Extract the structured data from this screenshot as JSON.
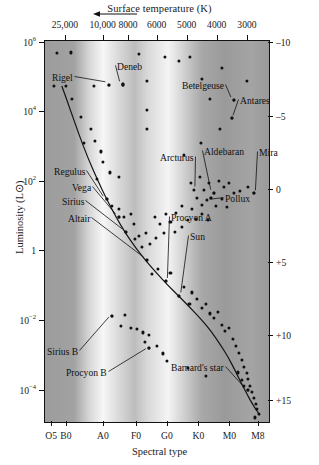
{
  "figure": {
    "type": "hertzsprung-russell-diagram",
    "top_axis_title": "Surface temperature (K)",
    "left_axis_title": "Luminosity (L⊙)",
    "right_axis_title": "Absolute magnitude",
    "bottom_axis_title": "Spectral type"
  },
  "chart_data": {
    "type": "scatter",
    "title": "",
    "xlabel": "Spectral type",
    "ylabel": "Luminosity (L⊙)",
    "grid": false,
    "legend": "none",
    "axes": {
      "top": {
        "label": "Surface temperature (K)",
        "direction": "decreasing-left-to-right",
        "ticks": [
          {
            "text": "25,000",
            "x_frac": 0.093
          },
          {
            "text": "10,000",
            "x_frac": 0.262
          },
          {
            "text": "8000",
            "x_frac": 0.375
          },
          {
            "text": "6000",
            "x_frac": 0.503
          },
          {
            "text": "5000",
            "x_frac": 0.637
          },
          {
            "text": "4000",
            "x_frac": 0.771
          },
          {
            "text": "3000",
            "x_frac": 0.906
          }
        ]
      },
      "left": {
        "label": "Luminosity (L⊙)",
        "scale": "log",
        "ticks": [
          {
            "mantissa": "10",
            "exp": "6",
            "text": "10⁶",
            "y_frac": 0.006
          },
          {
            "mantissa": "10",
            "exp": "4",
            "text": "10⁴",
            "y_frac": 0.186
          },
          {
            "mantissa": "10",
            "exp": "2",
            "text": "10²",
            "y_frac": 0.37
          },
          {
            "mantissa": "1",
            "exp": "",
            "text": "1",
            "y_frac": 0.551
          },
          {
            "mantissa": "10",
            "exp": "-2",
            "text": "10⁻²",
            "y_frac": 0.735
          },
          {
            "mantissa": "10",
            "exp": "-4",
            "text": "10⁻⁴",
            "y_frac": 0.919
          }
        ]
      },
      "right": {
        "label": "Absolute magnitude",
        "ticks": [
          {
            "text": "–10",
            "y_frac": 0.006
          },
          {
            "text": "–5",
            "y_frac": 0.199
          },
          {
            "text": "0",
            "y_frac": 0.391
          },
          {
            "text": "+5",
            "y_frac": 0.583
          },
          {
            "text": "+10",
            "y_frac": 0.775
          },
          {
            "text": "+15",
            "y_frac": 0.945
          }
        ]
      },
      "bottom": {
        "label": "Spectral type",
        "ticks": [
          {
            "text": "O5",
            "x_frac": 0.032
          },
          {
            "text": "B0",
            "x_frac": 0.098
          },
          {
            "text": "A0",
            "x_frac": 0.263
          },
          {
            "text": "F0",
            "x_frac": 0.411
          },
          {
            "text": "G0",
            "x_frac": 0.549
          },
          {
            "text": "K0",
            "x_frac": 0.689
          },
          {
            "text": "M0",
            "x_frac": 0.828
          },
          {
            "text": "M8",
            "x_frac": 0.955
          }
        ]
      }
    },
    "background_bands": [
      {
        "x_frac": 0.0,
        "color": "#9c9c9c"
      },
      {
        "x_frac": 0.13,
        "color": "#a2a2a2"
      },
      {
        "x_frac": 0.2,
        "color": "#d8d8d8"
      },
      {
        "x_frac": 0.26,
        "color": "#f7f7f7"
      },
      {
        "x_frac": 0.32,
        "color": "#dddddd"
      },
      {
        "x_frac": 0.4,
        "color": "#bdbdbd"
      },
      {
        "x_frac": 0.46,
        "color": "#d9d9d9"
      },
      {
        "x_frac": 0.55,
        "color": "#f4f4f4"
      },
      {
        "x_frac": 0.62,
        "color": "#d0d0d0"
      },
      {
        "x_frac": 0.7,
        "color": "#a8a8a8"
      },
      {
        "x_frac": 0.8,
        "color": "#9a9a9a"
      },
      {
        "x_frac": 0.92,
        "color": "#a4a4a4"
      },
      {
        "x_frac": 1.0,
        "color": "#9a9a9a"
      }
    ],
    "main_sequence_curve": [
      [
        0.075,
        0.118
      ],
      [
        0.11,
        0.175
      ],
      [
        0.15,
        0.243
      ],
      [
        0.19,
        0.305
      ],
      [
        0.232,
        0.362
      ],
      [
        0.275,
        0.415
      ],
      [
        0.318,
        0.463
      ],
      [
        0.36,
        0.505
      ],
      [
        0.405,
        0.543
      ],
      [
        0.452,
        0.578
      ],
      [
        0.5,
        0.61
      ],
      [
        0.548,
        0.641
      ],
      [
        0.598,
        0.67
      ],
      [
        0.648,
        0.7
      ],
      [
        0.698,
        0.731
      ],
      [
        0.742,
        0.762
      ],
      [
        0.782,
        0.796
      ],
      [
        0.818,
        0.83
      ],
      [
        0.85,
        0.866
      ],
      [
        0.878,
        0.9
      ],
      [
        0.903,
        0.928
      ],
      [
        0.924,
        0.951
      ],
      [
        0.943,
        0.968
      ],
      [
        0.96,
        0.982
      ]
    ],
    "named_stars": [
      {
        "name": "Rigel",
        "label_x": 52,
        "label_y": 72,
        "anchor": "left",
        "dot": [
          0.285,
          0.115
        ]
      },
      {
        "name": "Deneb",
        "label_x": 117,
        "label_y": 61,
        "anchor": "left",
        "dot": [
          0.348,
          0.114
        ]
      },
      {
        "name": "Betelgeuse",
        "label_x": 182,
        "label_y": 80,
        "anchor": "left",
        "dot": [
          0.845,
          0.155
        ]
      },
      {
        "name": "Antares",
        "label_x": 240,
        "label_y": 95,
        "anchor": "left",
        "dot": [
          0.833,
          0.203
        ]
      },
      {
        "name": "Arcturus",
        "label_x": 160,
        "label_y": 152,
        "anchor": "left",
        "dot": [
          0.663,
          0.39
        ]
      },
      {
        "name": "Aldebaran",
        "label_x": 204,
        "label_y": 146,
        "anchor": "left",
        "dot": [
          0.755,
          0.398
        ]
      },
      {
        "name": "Mira",
        "label_x": 259,
        "label_y": 147,
        "anchor": "left",
        "dot": [
          0.933,
          0.4
        ]
      },
      {
        "name": "Pollux",
        "label_x": 225,
        "label_y": 193,
        "anchor": "left",
        "dot": [
          0.74,
          0.412
        ]
      },
      {
        "name": "Regulus",
        "label_x": 54,
        "label_y": 166,
        "anchor": "left",
        "dot": [
          0.275,
          0.415
        ]
      },
      {
        "name": "Vega",
        "label_x": 72,
        "label_y": 182,
        "anchor": "left",
        "dot": [
          0.33,
          0.462
        ]
      },
      {
        "name": "Sirius",
        "label_x": 62,
        "label_y": 196,
        "anchor": "left",
        "dot": [
          0.36,
          0.501
        ]
      },
      {
        "name": "Altair",
        "label_x": 68,
        "label_y": 213,
        "anchor": "left",
        "dot": [
          0.455,
          0.575
        ]
      },
      {
        "name": "Procyon A",
        "label_x": 171,
        "label_y": 212,
        "anchor": "left",
        "dot": [
          0.54,
          0.63
        ]
      },
      {
        "name": "Sun",
        "label_x": 190,
        "label_y": 231,
        "anchor": "left",
        "dot": [
          0.6,
          0.668
        ]
      },
      {
        "name": "Sirius B",
        "label_x": 47,
        "label_y": 346,
        "anchor": "left",
        "dot": [
          0.3,
          0.722
        ]
      },
      {
        "name": "Procyon B",
        "label_x": 66,
        "label_y": 367,
        "anchor": "left",
        "dot": [
          0.465,
          0.805
        ]
      },
      {
        "name": "Barnard's star",
        "label_x": 171,
        "label_y": 362,
        "anchor": "left",
        "dot": [
          0.905,
          0.917
        ]
      }
    ],
    "scatter_points": [
      [
        0.055,
        0.032
      ],
      [
        0.115,
        0.03
      ],
      [
        0.418,
        0.033
      ],
      [
        0.535,
        0.043
      ],
      [
        0.648,
        0.042
      ],
      [
        0.04,
        0.118
      ],
      [
        0.092,
        0.118
      ],
      [
        0.218,
        0.117
      ],
      [
        0.285,
        0.115
      ],
      [
        0.348,
        0.114
      ],
      [
        0.455,
        0.105
      ],
      [
        0.598,
        0.052
      ],
      [
        0.7,
        0.1
      ],
      [
        0.79,
        0.07
      ],
      [
        0.9,
        0.106
      ],
      [
        0.455,
        0.182
      ],
      [
        0.735,
        0.152
      ],
      [
        0.845,
        0.155
      ],
      [
        0.833,
        0.203
      ],
      [
        0.12,
        0.152
      ],
      [
        0.16,
        0.2
      ],
      [
        0.205,
        0.23
      ],
      [
        0.175,
        0.268
      ],
      [
        0.225,
        0.262
      ],
      [
        0.25,
        0.29
      ],
      [
        0.26,
        0.318
      ],
      [
        0.232,
        0.362
      ],
      [
        0.29,
        0.345
      ],
      [
        0.33,
        0.358
      ],
      [
        0.695,
        0.268
      ],
      [
        0.78,
        0.232
      ],
      [
        0.455,
        0.232
      ],
      [
        0.62,
        0.3
      ],
      [
        0.275,
        0.415
      ],
      [
        0.33,
        0.44
      ],
      [
        0.352,
        0.462
      ],
      [
        0.33,
        0.462
      ],
      [
        0.36,
        0.501
      ],
      [
        0.398,
        0.48
      ],
      [
        0.42,
        0.512
      ],
      [
        0.455,
        0.575
      ],
      [
        0.3,
        0.432
      ],
      [
        0.383,
        0.455
      ],
      [
        0.652,
        0.372
      ],
      [
        0.69,
        0.356
      ],
      [
        0.71,
        0.39
      ],
      [
        0.73,
        0.372
      ],
      [
        0.755,
        0.398
      ],
      [
        0.775,
        0.368
      ],
      [
        0.8,
        0.382
      ],
      [
        0.82,
        0.372
      ],
      [
        0.845,
        0.4
      ],
      [
        0.87,
        0.393
      ],
      [
        0.905,
        0.382
      ],
      [
        0.933,
        0.4
      ],
      [
        0.68,
        0.412
      ],
      [
        0.7,
        0.43
      ],
      [
        0.722,
        0.418
      ],
      [
        0.74,
        0.412
      ],
      [
        0.762,
        0.432
      ],
      [
        0.79,
        0.415
      ],
      [
        0.812,
        0.435
      ],
      [
        0.655,
        0.44
      ],
      [
        0.612,
        0.432
      ],
      [
        0.585,
        0.452
      ],
      [
        0.56,
        0.475
      ],
      [
        0.54,
        0.455
      ],
      [
        0.512,
        0.48
      ],
      [
        0.49,
        0.462
      ],
      [
        0.64,
        0.47
      ],
      [
        0.672,
        0.468
      ],
      [
        0.7,
        0.455
      ],
      [
        0.728,
        0.47
      ],
      [
        0.61,
        0.488
      ],
      [
        0.582,
        0.5
      ],
      [
        0.53,
        0.505
      ],
      [
        0.495,
        0.518
      ],
      [
        0.505,
        0.598
      ],
      [
        0.54,
        0.63
      ],
      [
        0.478,
        0.612
      ],
      [
        0.56,
        0.608
      ],
      [
        0.6,
        0.668
      ],
      [
        0.62,
        0.645
      ],
      [
        0.655,
        0.66
      ],
      [
        0.645,
        0.69
      ],
      [
        0.68,
        0.678
      ],
      [
        0.7,
        0.7
      ],
      [
        0.718,
        0.69
      ],
      [
        0.735,
        0.715
      ],
      [
        0.755,
        0.728
      ],
      [
        0.772,
        0.712
      ],
      [
        0.79,
        0.745
      ],
      [
        0.805,
        0.762
      ],
      [
        0.822,
        0.752
      ],
      [
        0.838,
        0.782
      ],
      [
        0.852,
        0.8
      ],
      [
        0.866,
        0.818
      ],
      [
        0.878,
        0.838
      ],
      [
        0.89,
        0.855
      ],
      [
        0.9,
        0.872
      ],
      [
        0.908,
        0.888
      ],
      [
        0.916,
        0.905
      ],
      [
        0.905,
        0.917
      ],
      [
        0.925,
        0.922
      ],
      [
        0.932,
        0.938
      ],
      [
        0.94,
        0.952
      ],
      [
        0.948,
        0.965
      ],
      [
        0.955,
        0.978
      ],
      [
        0.938,
        0.988
      ],
      [
        0.89,
        0.905
      ],
      [
        0.878,
        0.89
      ],
      [
        0.862,
        0.87
      ],
      [
        0.3,
        0.722
      ],
      [
        0.355,
        0.718
      ],
      [
        0.34,
        0.748
      ],
      [
        0.382,
        0.752
      ],
      [
        0.412,
        0.755
      ],
      [
        0.438,
        0.765
      ],
      [
        0.465,
        0.772
      ],
      [
        0.448,
        0.79
      ],
      [
        0.465,
        0.805
      ],
      [
        0.5,
        0.8
      ],
      [
        0.528,
        0.82
      ],
      [
        0.545,
        0.84
      ],
      [
        0.64,
        0.858
      ],
      [
        0.718,
        0.88
      ],
      [
        0.4,
        0.52
      ],
      [
        0.432,
        0.54
      ],
      [
        0.452,
        0.505
      ],
      [
        0.47,
        0.532
      ]
    ]
  }
}
